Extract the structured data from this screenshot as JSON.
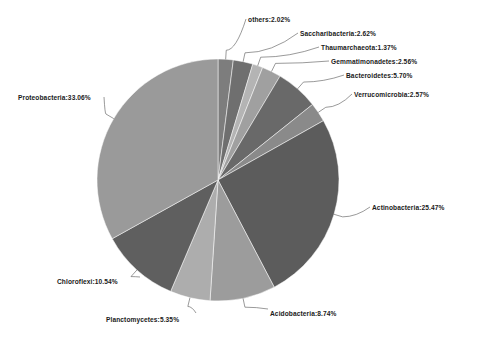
{
  "figure": {
    "type": "pie-chart",
    "caption": "",
    "background": "#ffffff"
  },
  "chart_data": {
    "type": "pie",
    "title": "",
    "xlabel": "",
    "ylabel": "",
    "units": "%",
    "legend_position": "callout-labels",
    "grid": false,
    "start_angle_deg": -90,
    "direction": "clockwise",
    "categories": [
      "others",
      "Saccharibacteria",
      "Thaumarchaeota",
      "Gemmatimonadetes",
      "Bacteroidetes",
      "Verrucomicrobia",
      "Actinobacteria",
      "Acidobacteria",
      "Planctomycetes",
      "Chloroflexi",
      "Proteobacteria"
    ],
    "values": [
      2.02,
      2.62,
      1.37,
      2.56,
      5.7,
      2.57,
      25.47,
      8.74,
      5.35,
      10.54,
      33.06
    ],
    "colors": [
      "#7d7d7d",
      "#6f6f6f",
      "#b4b4b4",
      "#a0a0a0",
      "#696969",
      "#8a8a8a",
      "#5c5c5c",
      "#9c9c9c",
      "#adadad",
      "#5f5f5f",
      "#9a9a9a"
    ],
    "slices": [
      {
        "name": "others",
        "label": "others:2.02%",
        "value": 2.02,
        "color": "#7d7d7d"
      },
      {
        "name": "Saccharibacteria",
        "label": "Saccharibacteria:2.62%",
        "value": 2.62,
        "color": "#6f6f6f"
      },
      {
        "name": "Thaumarchaeota",
        "label": "Thaumarchaeota:1.37%",
        "value": 1.37,
        "color": "#b4b4b4"
      },
      {
        "name": "Gemmatimonadetes",
        "label": "Gemmatimonadetes:2.56%",
        "value": 2.56,
        "color": "#a0a0a0"
      },
      {
        "name": "Bacteroidetes",
        "label": "Bacteroidetes:5.70%",
        "value": 5.7,
        "color": "#696969"
      },
      {
        "name": "Verrucomicrobia",
        "label": "Verrucomicrobia:2.57%",
        "value": 2.57,
        "color": "#8a8a8a"
      },
      {
        "name": "Actinobacteria",
        "label": "Actinobacteria:25.47%",
        "value": 25.47,
        "color": "#5c5c5c"
      },
      {
        "name": "Acidobacteria",
        "label": "Acidobacteria:8.74%",
        "value": 8.74,
        "color": "#9c9c9c"
      },
      {
        "name": "Planctomycetes",
        "label": "Planctomycetes:5.35%",
        "value": 5.35,
        "color": "#adadad"
      },
      {
        "name": "Chloroflexi",
        "label": "Chloroflexi:10.54%",
        "value": 10.54,
        "color": "#5f5f5f"
      },
      {
        "name": "Proteobacteria",
        "label": "Proteobacteria:33.06%",
        "value": 33.06,
        "color": "#9a9a9a"
      }
    ]
  },
  "labels": {
    "others": "others:2.02%",
    "saccharibacteria": "Saccharibacteria:2.62%",
    "thaumarchaeota": "Thaumarchaeota:1.37%",
    "gemmatimonadetes": "Gemmatimonadetes:2.56%",
    "bacteroidetes": "Bacteroidetes:5.70%",
    "verrucomicrobia": "Verrucomicrobia:2.57%",
    "actinobacteria": "Actinobacteria:25.47%",
    "acidobacteria": "Acidobacteria:8.74%",
    "planctomycetes": "Planctomycetes:5.35%",
    "chloroflexi": "Chloroflexi:10.54%",
    "proteobacteria": "Proteobacteria:33.06%"
  }
}
